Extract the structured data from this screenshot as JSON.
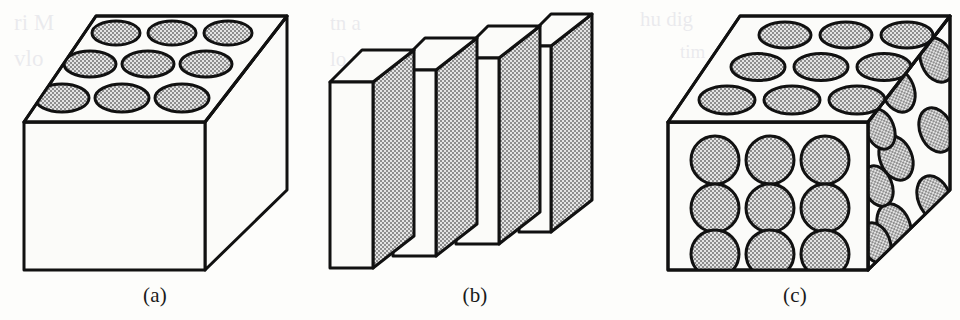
{
  "figure": {
    "background_color": "#fdfdfb",
    "ink_color": "#111111",
    "stipple_fill_color": "#a8a8a8",
    "face_fill_color": "#fbfbf9",
    "stroke_width": 3.0
  },
  "panels": [
    {
      "id": "a",
      "caption": "(a)",
      "kind": "cube-with-fibers-on-top-face",
      "description": "Cube with a 3x3 array of stippled ellipses on the top face; front and right faces blank",
      "faces": {
        "top": {
          "filled_shapes": 9,
          "rows": 3,
          "cols": 3,
          "shape": "ellipse",
          "fill": "stipple"
        },
        "front": {
          "filled_shapes": 0,
          "fill": "white"
        },
        "right": {
          "filled_shapes": 0,
          "fill": "white"
        }
      }
    },
    {
      "id": "b",
      "caption": "(b)",
      "kind": "stacked-laminate-plates",
      "description": "Four parallel plates (laminae) in perspective; white front faces with stippled side faces",
      "plate_count": 4,
      "plate_faces": {
        "front": "white",
        "top": "white",
        "side": "stipple"
      }
    },
    {
      "id": "c",
      "caption": "(c)",
      "kind": "cube-with-fibers-on-all-faces",
      "description": "Cube with stippled circles on the front face, ellipses on the top face and tilted ellipses on the right face",
      "faces": {
        "top": {
          "filled_shapes": 9,
          "rows": 3,
          "cols": 3,
          "shape": "ellipse",
          "fill": "stipple"
        },
        "front": {
          "filled_shapes": 9,
          "rows": 3,
          "cols": 3,
          "shape": "circle",
          "fill": "stipple"
        },
        "right": {
          "filled_shapes": 9,
          "rows": 3,
          "cols": 3,
          "shape": "ellipse",
          "fill": "stipple"
        }
      }
    }
  ]
}
